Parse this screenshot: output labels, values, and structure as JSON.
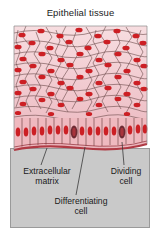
{
  "figure": {
    "title": "Epithelial tissue",
    "background_color": "#ffffff",
    "label_panel_color": "#c9c9c9",
    "label_panel_border_color": "#9a9a9a"
  },
  "labels": {
    "extracellular_matrix": "Extracellular\nmatrix",
    "extracellular_matrix_line1": "Extracellular",
    "extracellular_matrix_line2": "matrix",
    "dividing_cell_line1": "Dividing",
    "dividing_cell_line2": "cell",
    "differentiating_cell_line1": "Differentiating",
    "differentiating_cell_line2": "cell"
  },
  "diagram": {
    "type": "biological-illustration",
    "cell_fill_color": "#f2cdd2",
    "cell_fill_color_basal": "#efb9bf",
    "nucleus_color": "#cc1f24",
    "nucleus_color_dark": "#7d2430",
    "cell_outline_color": "#5c4040",
    "basement_membrane_color": "#b03a44",
    "layers": [
      {
        "name": "squamous-surface-layer",
        "description": "flattened squamous cells at apical surface"
      },
      {
        "name": "intermediate-layers",
        "description": "differentiating polygonal cells"
      },
      {
        "name": "basal-columnar-layer",
        "description": "columnar proliferative basal cells"
      },
      {
        "name": "basement-membrane",
        "description": "extracellular matrix boundary"
      }
    ],
    "dividing_cells": [
      {
        "x": 77,
        "y": 133
      },
      {
        "x": 122,
        "y": 135
      }
    ],
    "leader_lines": [
      {
        "target": "extracellular-matrix",
        "from_x": 47,
        "from_y": 147,
        "to_x": 41,
        "to_y": 164
      },
      {
        "target": "differentiating-cell",
        "from_x": 85,
        "from_y": 146,
        "to_x": 76,
        "to_y": 194
      },
      {
        "target": "dividing-cell",
        "from_x": 122,
        "from_y": 141,
        "to_x": 124,
        "to_y": 164
      }
    ]
  }
}
